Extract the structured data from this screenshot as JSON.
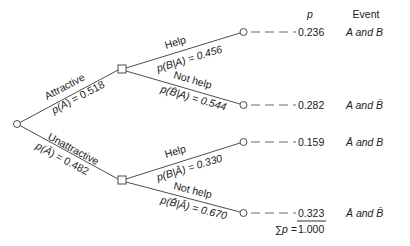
{
  "diagram": {
    "type": "probability-tree",
    "header": {
      "p_label": "p",
      "event_label": "Event"
    },
    "first_level": [
      {
        "name": "Attractive",
        "prob_expr_prefix": "p(",
        "prob_expr_symbol": "A",
        "prob_expr_suffix": ") = 0.518",
        "probability": 0.518
      },
      {
        "name": "Unattractive",
        "prob_expr_prefix": "p(",
        "prob_expr_symbol": "Ā",
        "prob_expr_suffix": ") = 0.482",
        "probability": 0.482
      }
    ],
    "second_level": [
      {
        "name": "Help",
        "prob_expr": "p(B|A) = 0.456",
        "probability": 0.456
      },
      {
        "name": "Not help",
        "prob_expr": "p(B̄|A) = 0.544",
        "probability": 0.544
      },
      {
        "name": "Help",
        "prob_expr": "p(B|Ā) = 0.330",
        "probability": 0.33
      },
      {
        "name": "Not help",
        "prob_expr": "p(B̄|Ā) = 0.670",
        "probability": 0.67
      }
    ],
    "outcomes": [
      {
        "p": "0.236",
        "event": "A and B"
      },
      {
        "p": "0.282",
        "event": "A and B̄"
      },
      {
        "p": "0.159",
        "event": "Ā and B"
      },
      {
        "p": "0.323",
        "event": "Ā and B̄"
      }
    ],
    "sum": {
      "label": "∑p = ",
      "value": "1.000"
    }
  }
}
